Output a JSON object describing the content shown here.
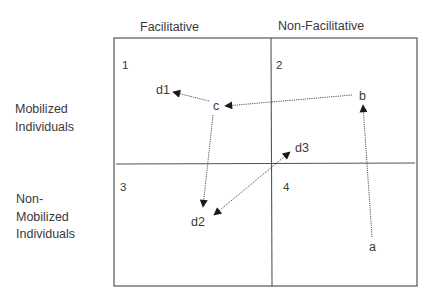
{
  "columns": [
    {
      "label": "Facilitative",
      "x": 140,
      "y": 31
    },
    {
      "label": "Non-Facilitative",
      "x": 278,
      "y": 30
    }
  ],
  "rows": [
    {
      "lines": [
        "Mobilized",
        "Individuals"
      ],
      "x": 15,
      "y": 113
    },
    {
      "lines": [
        "Non-",
        "Mobilized",
        "Individuals"
      ],
      "x": 16,
      "y": 203
    }
  ],
  "frame": {
    "x1": 114,
    "y1": 38,
    "x2": 417,
    "y2": 286,
    "vx": 271,
    "hy": 164
  },
  "quadrants": [
    {
      "label": "1",
      "x": 122,
      "y": 69
    },
    {
      "label": "2",
      "x": 276,
      "y": 69
    },
    {
      "label": "3",
      "x": 120,
      "y": 191
    },
    {
      "label": "4",
      "x": 283,
      "y": 191
    }
  ],
  "nodes": [
    {
      "id": "a",
      "label": "a",
      "x": 369,
      "y": 251
    },
    {
      "id": "b",
      "label": "b",
      "x": 359,
      "y": 100
    },
    {
      "id": "c",
      "label": "c",
      "x": 213,
      "y": 110
    },
    {
      "id": "d1",
      "label": "d1",
      "x": 156,
      "y": 94
    },
    {
      "id": "d2",
      "label": "d2",
      "x": 191,
      "y": 226
    },
    {
      "id": "d3",
      "label": "d3",
      "x": 295,
      "y": 152
    }
  ],
  "edges": [
    {
      "from": "a",
      "to": "b",
      "x1": 372,
      "y1": 237,
      "x2": 363,
      "y2": 105,
      "heads": [
        "end"
      ]
    },
    {
      "from": "b",
      "to": "c",
      "x1": 352,
      "y1": 95,
      "x2": 225,
      "y2": 106,
      "heads": [
        "end"
      ]
    },
    {
      "from": "c",
      "to": "d1",
      "x1": 209,
      "y1": 101,
      "x2": 173,
      "y2": 92,
      "heads": [
        "end"
      ]
    },
    {
      "from": "c",
      "to": "d2",
      "x1": 213,
      "y1": 115,
      "x2": 203,
      "y2": 207,
      "heads": [
        "end"
      ]
    },
    {
      "from": "d2",
      "to": "d3",
      "x1": 214,
      "y1": 215,
      "x2": 290,
      "y2": 152,
      "heads": [
        "start",
        "end"
      ]
    }
  ],
  "colors": {
    "ink": "#3a3a3a",
    "line": "#555555",
    "background": "#ffffff"
  }
}
